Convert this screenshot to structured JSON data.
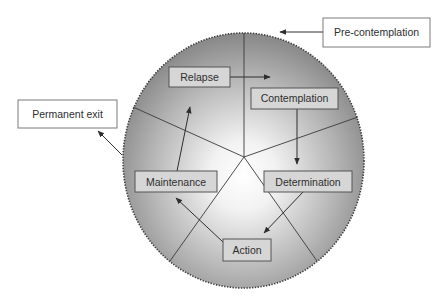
{
  "diagram": {
    "type": "cycle-of-change",
    "colors": {
      "circle_center": "#ffffff",
      "circle_edge": "#8a8a8a",
      "inner_box_fill": "#d6d6d6",
      "outer_box_fill": "#ffffff",
      "border": "#555555",
      "text": "#2e2e2e"
    },
    "stages": {
      "precontemplation": "Pre-contemplation",
      "contemplation": "Contemplation",
      "determination": "Determination",
      "action": "Action",
      "maintenance": "Maintenance",
      "relapse": "Relapse",
      "permanent_exit": "Permanent exit"
    },
    "flows": [
      {
        "from": "Pre-contemplation",
        "to": "circle"
      },
      {
        "from": "Relapse",
        "to": "Contemplation sector"
      },
      {
        "from": "Contemplation",
        "to": "Determination"
      },
      {
        "from": "Determination",
        "to": "Action"
      },
      {
        "from": "Action",
        "to": "Maintenance"
      },
      {
        "from": "Maintenance",
        "to": "Relapse"
      },
      {
        "from": "circle",
        "to": "Permanent exit"
      }
    ]
  }
}
